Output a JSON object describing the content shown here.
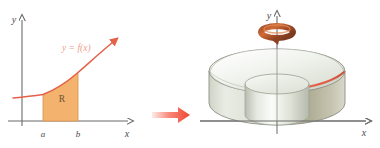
{
  "figure": {
    "caption": "",
    "panels": [
      {
        "id": "region-plot",
        "name": "plane-region-R",
        "axis_x_label": "x",
        "axis_y_label": "y",
        "curve_label": "y = f(x)",
        "region_label": "R",
        "tick_a_label": "a",
        "tick_b_label": "b"
      },
      {
        "id": "solid-plot",
        "name": "solid-of-revolution",
        "axis_x_label": "x",
        "axis_y_label": "y",
        "rotation_icon": "rotation-arrow-icon"
      }
    ],
    "transition_arrow": "right-arrow-icon"
  },
  "colors": {
    "curve": "#e4614a",
    "region_fill": "#f3b26e",
    "region_stroke": "#d98c3a",
    "axis": "#6b6b6b",
    "label_text": "#4a4a4a",
    "curve_label_text": "#f0a08c",
    "arrow_red": "#f04a36",
    "arrow_pale": "#fbd8d2",
    "rotation_arrow": "#b5572d",
    "solid_light": "#e8ece3",
    "solid_mid": "#cdd2c4",
    "solid_shade": "#b3b09a",
    "solid_outline": "#8d8d83",
    "background": "#ffffff"
  }
}
